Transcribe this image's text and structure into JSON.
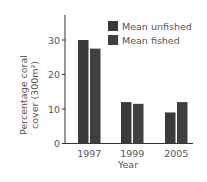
{
  "chart_data": {
    "type": "bar",
    "title": "",
    "xlabel": "Year",
    "ylabel_line1": "Percentage coral",
    "ylabel_line2": "cover (300m²)",
    "ylabel": "Percentage coral cover (300m²)",
    "categories": [
      "1997",
      "1999",
      "2005"
    ],
    "series": [
      {
        "name": "Mean unfished",
        "values": [
          30,
          12,
          9
        ],
        "color": "#3a3a3a"
      },
      {
        "name": "Mean fished",
        "values": [
          27.5,
          11.5,
          12
        ],
        "color": "#3f3f3f"
      }
    ],
    "ylim": [
      0,
      37
    ],
    "yticks": [
      0,
      10,
      20,
      30
    ],
    "grid": false,
    "legend_position": "upper right"
  }
}
